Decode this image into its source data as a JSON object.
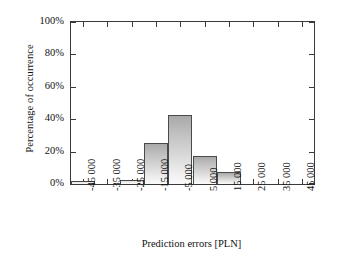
{
  "chart_data": {
    "type": "bar",
    "title": "",
    "subtitle": "",
    "xlabel": "Prediction errors [PLN]",
    "ylabel": "Percentage of occurrence",
    "categories": [
      "-45 000",
      "-35 000",
      "-25 000",
      "-15 000",
      "-5 000",
      "5 000",
      "15 000",
      "25 000",
      "35 000",
      "45 000"
    ],
    "values": [
      1.7,
      0,
      2.2,
      25.3,
      42.6,
      17.3,
      7.4,
      0,
      0,
      0
    ],
    "ylim": [
      0,
      100
    ],
    "ytick_values": [
      0,
      20,
      40,
      60,
      80,
      100
    ],
    "ytick_labels": [
      "0%",
      "20%",
      "40%",
      "60%",
      "80%",
      "100%"
    ],
    "grid": false,
    "legend": false,
    "legend_position": "none",
    "bar_fill_top": "#a9a9a9",
    "bar_fill_bottom": "#fafafa",
    "bar_outline": "#4a4a4a",
    "axis_color": "#3a3a3a",
    "background": "#ffffff"
  }
}
